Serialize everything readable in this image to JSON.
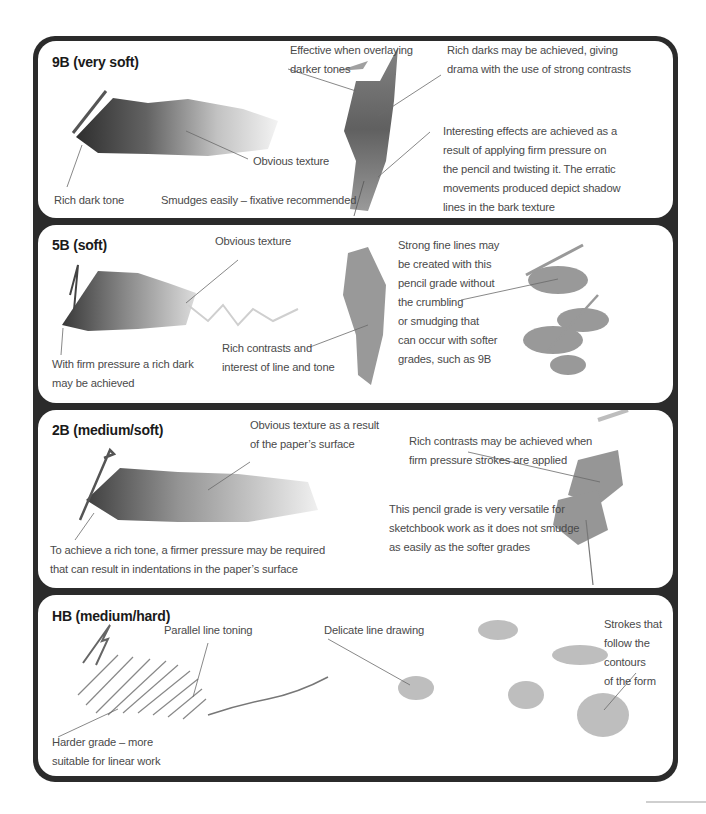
{
  "panels": [
    {
      "title": "9B (very soft)",
      "labels": {
        "rich_dark_tone": "Rich dark tone",
        "obvious_texture": "Obvious texture",
        "smudges": "Smudges easily – fixative recommended",
        "overlaying_1": "Effective when overlaying",
        "overlaying_2": "darker tones",
        "rich_darks_1": "Rich darks may be achieved, giving",
        "rich_darks_2": "drama with the use of strong contrasts",
        "interesting_1": "Interesting effects are achieved as a",
        "interesting_2": "result of applying firm pressure on",
        "interesting_3": "the pencil and twisting it. The erratic",
        "interesting_4": "movements produced depict shadow",
        "interesting_5": "lines in the bark texture"
      }
    },
    {
      "title": "5B (soft)",
      "labels": {
        "obvious_texture": "Obvious texture",
        "firm_pressure_1": "With firm pressure a rich dark",
        "firm_pressure_2": "may be achieved",
        "rich_contrasts_1": "Rich contrasts and",
        "rich_contrasts_2": "interest of line and tone",
        "fine_lines_1": "Strong fine lines may",
        "fine_lines_2": "be created with this",
        "fine_lines_3": "pencil grade without",
        "fine_lines_4": "the crumbling",
        "fine_lines_5": "or smudging that",
        "fine_lines_6": "can occur with softer",
        "fine_lines_7": "grades, such as 9B"
      }
    },
    {
      "title": "2B (medium/soft)",
      "labels": {
        "texture_1": "Obvious texture as a result",
        "texture_2": "of the paper’s surface",
        "rich_tone_1": "To achieve a rich tone, a firmer pressure may be required",
        "rich_tone_2": "that can result in indentations in the paper’s surface",
        "contrasts_1": "Rich contrasts may be achieved when",
        "contrasts_2": "firm pressure strokes are applied",
        "versatile_1": "This pencil grade is very versatile for",
        "versatile_2": "sketchbook work as it does not smudge",
        "versatile_3": "as easily as the softer grades"
      }
    },
    {
      "title": "HB (medium/hard)",
      "labels": {
        "parallel": "Parallel line toning",
        "delicate": "Delicate line drawing",
        "harder_1": "Harder grade – more",
        "harder_2": "suitable for linear work",
        "strokes_1": "Strokes that",
        "strokes_2": "follow the",
        "strokes_3": "contours",
        "strokes_4": "of the form"
      }
    }
  ],
  "colors": {
    "frame": "#2b2b2b",
    "panel": "#ffffff",
    "text": "#4a4a4a",
    "title": "#1a1a1a",
    "leader_line": "#6a6a6a"
  }
}
